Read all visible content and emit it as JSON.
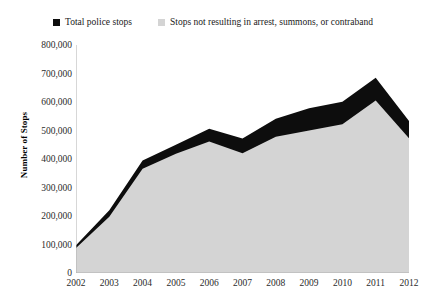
{
  "chart_data": {
    "type": "area",
    "title": "",
    "subtitle": "",
    "xlabel": "",
    "ylabel": "Number of Stops",
    "categories": [
      "2002",
      "2003",
      "2004",
      "2005",
      "2006",
      "2007",
      "2008",
      "2009",
      "2010",
      "2011",
      "2012"
    ],
    "x": [
      2002,
      2003,
      2004,
      2005,
      2006,
      2007,
      2008,
      2009,
      2010,
      2011,
      2012
    ],
    "ylim": [
      0,
      800000
    ],
    "xlim": [
      2002,
      2012
    ],
    "y_ticks": [
      0,
      100000,
      200000,
      300000,
      400000,
      500000,
      600000,
      700000,
      800000
    ],
    "y_tick_labels": [
      "0",
      "100,000",
      "200,000",
      "300,000",
      "400,000",
      "500,000",
      "600,000",
      "700,000",
      "800,000"
    ],
    "grid": false,
    "legend_position": "top",
    "stacked": false,
    "series": [
      {
        "name": "Total police stops",
        "color": "#0d0d0d",
        "values": [
          97000,
          220000,
          395000,
          450000,
          506000,
          472000,
          541000,
          578000,
          601000,
          685000,
          533000
        ]
      },
      {
        "name": "Stops not resulting in arrest, summons, or contraband",
        "color": "#d4d4d4",
        "values": [
          88000,
          197000,
          366000,
          418000,
          461000,
          420000,
          478000,
          500000,
          522000,
          605000,
          473000
        ]
      }
    ]
  },
  "legend": {
    "entries": [
      {
        "label": "Total police stops",
        "color": "#0d0d0d",
        "swatch": "square-swatch"
      },
      {
        "label": "Stops not resulting in arrest, summons, or contraband",
        "color": "#d4d4d4",
        "swatch": "square-swatch"
      }
    ]
  },
  "axes": {
    "y_title": "Number of Stops"
  }
}
